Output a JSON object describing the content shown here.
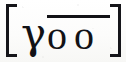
{
  "figure": {
    "name": "bracketed-phonetic-notation",
    "full_text": "[γ o͞o]",
    "background_color": "#fbfbfa",
    "ink_color": "#121216"
  },
  "brackets": {
    "open": "[",
    "close": "]"
  },
  "glyphs": {
    "gamma": "γ",
    "o_pair": "oo"
  },
  "diacritic": {
    "name": "macron-overbar",
    "character": "̄",
    "spans": "oo"
  }
}
